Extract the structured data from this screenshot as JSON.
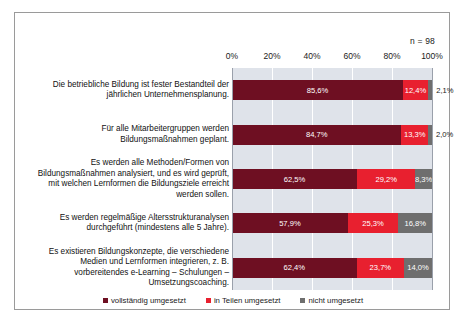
{
  "sample_note": "n = 98",
  "legend": [
    {
      "label": "vollständig umgesetzt",
      "color": "#6e0f22"
    },
    {
      "label": "in Teilen umgesetzt",
      "color": "#e8202f"
    },
    {
      "label": "nicht umgesetzt",
      "color": "#6e6e6e"
    }
  ],
  "chart_data": {
    "type": "bar",
    "title": "",
    "subtitle": "",
    "xlabel": "",
    "ylabel": "",
    "orientation": "horizontal",
    "stacked": true,
    "stack_total": 100,
    "xlim": [
      0,
      100
    ],
    "grid": true,
    "legend_position": "bottom",
    "annotations": [
      "n = 98"
    ],
    "tick_labels": [
      "0%",
      "20%",
      "40%",
      "60%",
      "80%",
      "100%"
    ],
    "tick_values": [
      0,
      20,
      40,
      60,
      80,
      100
    ],
    "categories": [
      "Die betriebliche Bildung ist fester Bestandteil der jährlichen Unternehmensplanung.",
      "Für alle Mitarbeitergruppen werden Bildungsmaßnahmen geplant.",
      "Es werden alle Methoden/Formen von Bildungsmaßnahmen analysiert, und es wird geprüft, mit welchen Lernformen die Bildungsziele erreicht werden sollen.",
      "Es werden regelmäßige Altersstrukturanalysen durchgeführt (mindestens alle 5 Jahre).",
      "Es existieren Bildungskonzepte, die verschiedene Medien und Lernformen integrieren, z. B. vorbereitendes e-Learning – Schulungen – Umsetzungscoaching."
    ],
    "series": [
      {
        "name": "vollständig umgesetzt",
        "color": "#6e0f22",
        "values": [
          85.6,
          84.7,
          62.5,
          57.9,
          62.4
        ],
        "labels": [
          "85,6%",
          "84,7%",
          "62,5%",
          "57,9%",
          "62,4%"
        ]
      },
      {
        "name": "in Teilen umgesetzt",
        "color": "#e8202f",
        "values": [
          12.4,
          13.3,
          29.2,
          25.3,
          23.7
        ],
        "labels": [
          "12,4%",
          "13,3%",
          "29,2%",
          "25,3%",
          "23,7%"
        ]
      },
      {
        "name": "nicht umgesetzt",
        "color": "#6e6e6e",
        "values": [
          2.1,
          2.0,
          8.3,
          16.8,
          14.0
        ],
        "labels": [
          "2,1%",
          "2,0%",
          "8,3%",
          "16,8%",
          "14,0%"
        ]
      }
    ]
  }
}
